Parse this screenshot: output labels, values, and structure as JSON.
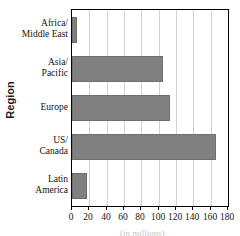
{
  "chart_data": {
    "type": "bar",
    "orientation": "horizontal",
    "title": "",
    "xlabel": "",
    "ylabel": "Region",
    "categories": [
      "Africa/ Middle East",
      "Asia/ Pacific",
      "Europe",
      "US/ Canada",
      "Latin America"
    ],
    "category_lines": [
      [
        "Africa/",
        "Middle East"
      ],
      [
        "Asia/",
        "Pacific"
      ],
      [
        "Europe"
      ],
      [
        "US/",
        "Canada"
      ],
      [
        "Latin",
        "America"
      ]
    ],
    "values": [
      6,
      105,
      113,
      166,
      17
    ],
    "xlim": [
      0,
      180
    ],
    "xticks": [
      0,
      20,
      40,
      60,
      80,
      100,
      120,
      140,
      160,
      180
    ],
    "xtick_labels": [
      "0",
      "20",
      "40",
      "60",
      "80",
      "100",
      "120",
      "140",
      "160",
      "180"
    ],
    "grid": "vertical",
    "legend": "none",
    "bar_color": "#808080",
    "bar_edge_color": "#6e6e6e",
    "gridline_color": "#d2d2d2",
    "frame_color": "#000000",
    "caption_partial": "(in millions)"
  }
}
